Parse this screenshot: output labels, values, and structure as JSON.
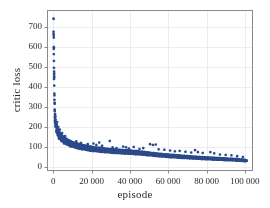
{
  "chart_data": {
    "type": "scatter",
    "title": "",
    "xlabel": "episode",
    "ylabel": "critic loss",
    "xlim": [
      -3000,
      104000
    ],
    "ylim": [
      -20,
      780
    ],
    "xticks": [
      0,
      20000,
      40000,
      60000,
      80000,
      100000
    ],
    "xtick_labels": [
      "0",
      "20 000",
      "40 000",
      "60 000",
      "80 000",
      "100 000"
    ],
    "yticks": [
      0,
      100,
      200,
      300,
      400,
      500,
      600,
      700
    ],
    "ytick_labels": [
      "0",
      "100",
      "200",
      "300",
      "400",
      "500",
      "600",
      "700"
    ],
    "grid": true,
    "grid_color": "#e8e8ec",
    "frame_color": "#8a8a8a",
    "marker_color": "#2b4a8b",
    "marker_size": 1.3,
    "legend": null,
    "series": [
      {
        "name": "critic loss",
        "description": "Per-episode critic loss, sampled roughly every 200 episodes; starts near 740 and decays toward ~30 with sparse high outliers.",
        "points": [
          [
            150,
            740
          ],
          [
            250,
            588
          ],
          [
            350,
            528
          ],
          [
            450,
            458
          ],
          [
            600,
            365
          ],
          [
            750,
            285
          ],
          [
            900,
            243
          ],
          [
            1000,
            232
          ],
          [
            1100,
            225
          ],
          [
            1200,
            215
          ],
          [
            1400,
            205
          ],
          [
            1600,
            196
          ],
          [
            1800,
            188
          ],
          [
            2000,
            182
          ],
          [
            2200,
            176
          ],
          [
            2400,
            172
          ],
          [
            2600,
            167
          ],
          [
            2800,
            163
          ],
          [
            3000,
            160
          ],
          [
            3200,
            157
          ],
          [
            3400,
            154
          ],
          [
            3600,
            151
          ],
          [
            3800,
            149
          ],
          [
            4000,
            147
          ],
          [
            4200,
            145
          ],
          [
            4400,
            143
          ],
          [
            4600,
            141
          ],
          [
            4800,
            139
          ],
          [
            5000,
            137
          ],
          [
            5200,
            136
          ],
          [
            5400,
            134
          ],
          [
            5600,
            133
          ],
          [
            5800,
            131
          ],
          [
            6000,
            130
          ],
          [
            6200,
            129
          ],
          [
            6400,
            127
          ],
          [
            6600,
            126
          ],
          [
            6800,
            125
          ],
          [
            7000,
            124
          ],
          [
            7200,
            123
          ],
          [
            7400,
            122
          ],
          [
            7600,
            121
          ],
          [
            7800,
            120
          ],
          [
            8000,
            119
          ],
          [
            8200,
            118
          ],
          [
            8400,
            117
          ],
          [
            8600,
            116
          ],
          [
            8800,
            115
          ],
          [
            9000,
            115
          ],
          [
            9200,
            114
          ],
          [
            9400,
            113
          ],
          [
            9600,
            112
          ],
          [
            9800,
            112
          ],
          [
            10000,
            111
          ],
          [
            10500,
            109
          ],
          [
            11000,
            108
          ],
          [
            11500,
            106
          ],
          [
            12000,
            105
          ],
          [
            12500,
            103
          ],
          [
            13000,
            102
          ],
          [
            13500,
            101
          ],
          [
            14000,
            100
          ],
          [
            14500,
            99
          ],
          [
            15000,
            98
          ],
          [
            15500,
            97
          ],
          [
            16000,
            96
          ],
          [
            16500,
            95
          ],
          [
            17000,
            94
          ],
          [
            17500,
            93
          ],
          [
            18000,
            92
          ],
          [
            18500,
            91
          ],
          [
            19000,
            90
          ],
          [
            19500,
            90
          ],
          [
            20000,
            89
          ],
          [
            20500,
            88
          ],
          [
            21000,
            88
          ],
          [
            21500,
            87
          ],
          [
            22000,
            86
          ],
          [
            22500,
            86
          ],
          [
            23000,
            85
          ],
          [
            23500,
            85
          ],
          [
            24000,
            84
          ],
          [
            24500,
            84
          ],
          [
            25000,
            83
          ],
          [
            25500,
            83
          ],
          [
            26000,
            82
          ],
          [
            26500,
            82
          ],
          [
            27000,
            81
          ],
          [
            27500,
            81
          ],
          [
            28000,
            80
          ],
          [
            28500,
            80
          ],
          [
            29000,
            79
          ],
          [
            29500,
            79
          ],
          [
            30000,
            79
          ],
          [
            30500,
            78
          ],
          [
            31000,
            78
          ],
          [
            31500,
            77
          ],
          [
            32000,
            77
          ],
          [
            32500,
            77
          ],
          [
            33000,
            76
          ],
          [
            33500,
            76
          ],
          [
            34000,
            76
          ],
          [
            34500,
            75
          ],
          [
            35000,
            75
          ],
          [
            35500,
            75
          ],
          [
            36000,
            74
          ],
          [
            36500,
            74
          ],
          [
            37000,
            74
          ],
          [
            37500,
            73
          ],
          [
            38000,
            73
          ],
          [
            38500,
            73
          ],
          [
            39000,
            72
          ],
          [
            39500,
            72
          ],
          [
            40000,
            72
          ],
          [
            41000,
            71
          ],
          [
            42000,
            70
          ],
          [
            43000,
            70
          ],
          [
            44000,
            69
          ],
          [
            45000,
            68
          ],
          [
            46000,
            67
          ],
          [
            47000,
            66
          ],
          [
            48000,
            65
          ],
          [
            49000,
            64
          ],
          [
            50000,
            63
          ],
          [
            51000,
            62
          ],
          [
            52000,
            61
          ],
          [
            53000,
            60
          ],
          [
            54000,
            59
          ],
          [
            55000,
            58
          ],
          [
            56000,
            57
          ],
          [
            57000,
            56
          ],
          [
            58000,
            55
          ],
          [
            59000,
            55
          ],
          [
            60000,
            54
          ],
          [
            61000,
            53
          ],
          [
            62000,
            52
          ],
          [
            63000,
            52
          ],
          [
            64000,
            51
          ],
          [
            65000,
            50
          ],
          [
            66000,
            50
          ],
          [
            67000,
            49
          ],
          [
            68000,
            48
          ],
          [
            69000,
            48
          ],
          [
            70000,
            47
          ],
          [
            71000,
            46
          ],
          [
            72000,
            46
          ],
          [
            73000,
            45
          ],
          [
            74000,
            45
          ],
          [
            75000,
            44
          ],
          [
            76000,
            43
          ],
          [
            77000,
            43
          ],
          [
            78000,
            42
          ],
          [
            79000,
            42
          ],
          [
            80000,
            41
          ],
          [
            81000,
            41
          ],
          [
            82000,
            40
          ],
          [
            83000,
            40
          ],
          [
            84000,
            39
          ],
          [
            85000,
            39
          ],
          [
            86000,
            38
          ],
          [
            87000,
            38
          ],
          [
            88000,
            37
          ],
          [
            89000,
            37
          ],
          [
            90000,
            36
          ],
          [
            91000,
            36
          ],
          [
            92000,
            35
          ],
          [
            93000,
            35
          ],
          [
            94000,
            34
          ],
          [
            95000,
            34
          ],
          [
            96000,
            33
          ],
          [
            97000,
            33
          ],
          [
            98000,
            32
          ],
          [
            99000,
            31
          ],
          [
            100000,
            30
          ],
          [
            101000,
            29
          ]
        ],
        "outliers": [
          [
            2000,
            222
          ],
          [
            2600,
            198
          ],
          [
            3400,
            185
          ],
          [
            4600,
            168
          ],
          [
            6200,
            152
          ],
          [
            12000,
            126
          ],
          [
            14500,
            118
          ],
          [
            18000,
            112
          ],
          [
            21000,
            115
          ],
          [
            22500,
            108
          ],
          [
            24000,
            120
          ],
          [
            25500,
            104
          ],
          [
            29500,
            128
          ],
          [
            31000,
            96
          ],
          [
            33000,
            92
          ],
          [
            36500,
            100
          ],
          [
            38000,
            96
          ],
          [
            39500,
            90
          ],
          [
            42000,
            98
          ],
          [
            45000,
            88
          ],
          [
            47000,
            92
          ],
          [
            50500,
            112
          ],
          [
            52000,
            108
          ],
          [
            53500,
            110
          ],
          [
            55000,
            86
          ],
          [
            58000,
            84
          ],
          [
            61000,
            80
          ],
          [
            63500,
            76
          ],
          [
            66000,
            78
          ],
          [
            69000,
            74
          ],
          [
            72000,
            70
          ],
          [
            74000,
            82
          ],
          [
            75500,
            72
          ],
          [
            78000,
            68
          ],
          [
            82000,
            72
          ],
          [
            84000,
            66
          ],
          [
            87000,
            60
          ],
          [
            90000,
            58
          ],
          [
            93000,
            56
          ],
          [
            96000,
            52
          ],
          [
            99000,
            48
          ]
        ]
      }
    ]
  },
  "figure": {
    "xlabel": "episode",
    "ylabel": "critic loss"
  }
}
